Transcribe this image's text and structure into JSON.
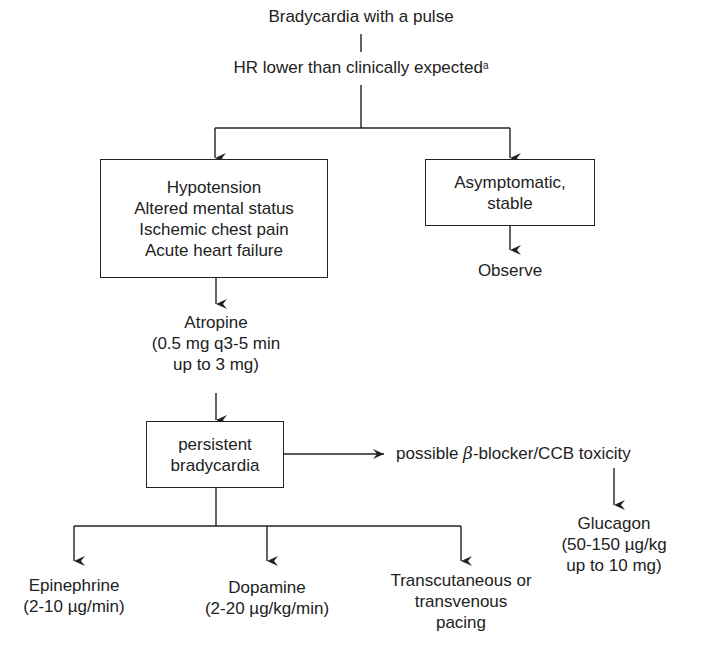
{
  "diagram": {
    "title": "Bradycardia with a pulse",
    "criteria": {
      "text": "HR lower than clinically expected",
      "footnote_mark": "a"
    },
    "symptomatic_box": {
      "lines": [
        "Hypotension",
        "Altered mental status",
        "Ischemic chest pain",
        "Acute heart failure"
      ]
    },
    "stable_box": {
      "lines": [
        "Asymptomatic,",
        "stable"
      ]
    },
    "observe": "Observe",
    "atropine": {
      "lines": [
        "Atropine",
        "(0.5 mg q3-5 min",
        "up to 3 mg)"
      ]
    },
    "persistent_box": {
      "lines": [
        "persistent",
        "bradycardia"
      ]
    },
    "toxicity": {
      "prefix": "possible ",
      "beta": "β",
      "suffix": "-blocker/CCB toxicity"
    },
    "glucagon": {
      "lines": [
        "Glucagon",
        "(50-150 µg/kg",
        "up to 10 mg)"
      ]
    },
    "epinephrine": {
      "lines": [
        "Epinephrine",
        "(2-10 µg/min)"
      ]
    },
    "dopamine": {
      "lines": [
        "Dopamine",
        "(2-20 µg/kg/min)"
      ]
    },
    "pacing": {
      "lines": [
        "Transcutaneous or",
        "transvenous",
        "pacing"
      ]
    },
    "colors": {
      "line": "#222222",
      "text": "#222222",
      "background": "#ffffff"
    }
  }
}
